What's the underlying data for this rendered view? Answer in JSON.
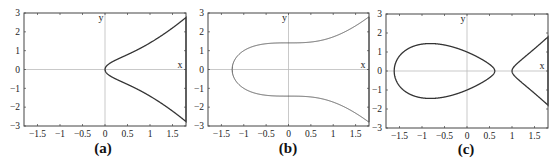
{
  "chart_data": [
    {
      "type": "line",
      "caption": "(a)",
      "equation": "y^2 = x^3 + x",
      "xlabel": "x",
      "ylabel": "y",
      "xlim": [
        -1.8,
        1.8
      ],
      "ylim": [
        -3,
        3
      ],
      "xticks": [
        -1.5,
        -1,
        -0.5,
        0,
        0.5,
        1,
        1.5
      ],
      "xtick_labels": [
        "-1.5",
        "-1",
        "-0.5",
        "0",
        "0.5",
        "1",
        "1.5"
      ],
      "yticks": [
        -3,
        -2,
        -1,
        0,
        1,
        2,
        3
      ],
      "ytick_labels": [
        "-3",
        "-2",
        "-1",
        "0",
        "1",
        "2",
        "3"
      ],
      "grid": false,
      "coeffs": {
        "a": 1,
        "b": 0
      },
      "curve_color": "#333333",
      "curve_width": 1.3
    },
    {
      "type": "line",
      "caption": "(b)",
      "equation": "y^2 = x^3 + 2",
      "xlabel": "x",
      "ylabel": "y",
      "xlim": [
        -1.8,
        1.8
      ],
      "ylim": [
        -3,
        3
      ],
      "xticks": [
        -1.5,
        -1,
        -0.5,
        0,
        0.5,
        1,
        1.5
      ],
      "xtick_labels": [
        "-1.5",
        "-1",
        "-0.5",
        "0",
        "0.5",
        "1",
        "1.5"
      ],
      "yticks": [
        -3,
        -2,
        -1,
        0,
        1,
        2,
        3
      ],
      "ytick_labels": [
        "-3",
        "-2",
        "-1",
        "0",
        "1",
        "2",
        "3"
      ],
      "grid": false,
      "coeffs": {
        "a": 0,
        "b": 2
      },
      "curve_color": "#555555",
      "curve_width": 1.0
    },
    {
      "type": "line",
      "caption": "(c)",
      "equation": "y^2 = x^3 - 2x + 1",
      "xlabel": "x",
      "ylabel": "y",
      "xlim": [
        -1.8,
        1.8
      ],
      "ylim": [
        -3,
        3
      ],
      "xticks": [
        -1.5,
        -1,
        -0.5,
        0,
        0.5,
        1,
        1.5
      ],
      "xtick_labels": [
        "-1.5",
        "-1",
        "-0.5",
        "0",
        "0.5",
        "1",
        "1.5"
      ],
      "yticks": [
        -3,
        -2,
        -1,
        0,
        1,
        2,
        3
      ],
      "ytick_labels": [
        "-3",
        "-2",
        "-1",
        "0",
        "1",
        "2",
        "3"
      ],
      "grid": false,
      "coeffs": {
        "a": -2,
        "b": 1
      },
      "curve_color": "#333333",
      "curve_width": 1.3
    }
  ],
  "layout": {
    "frames": [
      {
        "left": 24,
        "top": 13,
        "right": 186,
        "bottom": 126,
        "caption_x": 103,
        "caption_y": 152
      },
      {
        "left": 208,
        "top": 13,
        "right": 369,
        "bottom": 126,
        "caption_x": 288,
        "caption_y": 152
      },
      {
        "left": 386,
        "top": 14,
        "right": 548,
        "bottom": 128,
        "caption_x": 466,
        "caption_y": 153
      }
    ],
    "axis_color": "#444444",
    "zero_line_color": "#bbbbbb"
  }
}
